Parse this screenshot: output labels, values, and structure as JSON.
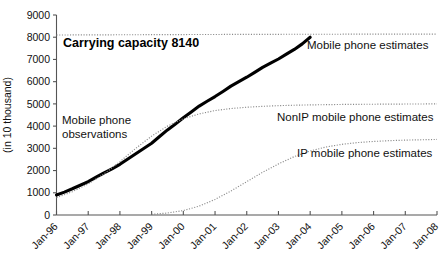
{
  "chart_data": {
    "type": "line",
    "title": "",
    "xlabel": "",
    "ylabel": "(in 10 thousand)",
    "xlim": [
      1996.0,
      2008.0
    ],
    "ylim": [
      0,
      9000
    ],
    "grid": false,
    "legend_position": "inline-annotations",
    "x_tick_labels": [
      "Jan-96",
      "Jan-97",
      "Jan-98",
      "Jan-99",
      "Jan-00",
      "Jan-01",
      "Jan-02",
      "Jan-03",
      "Jan-04",
      "Jan-05",
      "Jan-06",
      "Jan-07",
      "Jan-08"
    ],
    "y_tick_labels": [
      "0",
      "1000",
      "2000",
      "3000",
      "4000",
      "5000",
      "6000",
      "7000",
      "8000",
      "9000"
    ],
    "y_ticks": [
      0,
      1000,
      2000,
      3000,
      4000,
      5000,
      6000,
      7000,
      8000,
      9000
    ],
    "annotations": [
      {
        "id": "carrying-capacity",
        "text": "Carrying capacity 8140",
        "value": 8140,
        "bold": true
      },
      {
        "id": "mobile-phone-observations",
        "text": "Mobile phone\nobservations",
        "line1": "Mobile phone",
        "line2": "observations",
        "bold": false
      },
      {
        "id": "mobile-phone-estimates",
        "text": "Mobile phone estimates",
        "bold": false
      },
      {
        "id": "nonip-mobile-phone-estimates",
        "text": "NonIP mobile phone estimates",
        "bold": false
      },
      {
        "id": "ip-mobile-phone-estimates",
        "text": "IP mobile phone estimates",
        "bold": false
      }
    ],
    "series": [
      {
        "name": "Mobile phone observations",
        "style": "solid-thick",
        "color": "#000000",
        "x": [
          1996.0,
          1996.25,
          1996.5,
          1996.75,
          1997.0,
          1997.25,
          1997.5,
          1997.75,
          1998.0,
          1998.25,
          1998.5,
          1998.75,
          1999.0,
          1999.25,
          1999.5,
          1999.75,
          2000.0,
          2000.25,
          2000.5,
          2000.75,
          2001.0,
          2001.25,
          2001.5,
          2001.75,
          2002.0,
          2002.25,
          2002.5,
          2002.75,
          2003.0,
          2003.25,
          2003.5,
          2003.75,
          2004.0
        ],
        "values": [
          900,
          1030,
          1180,
          1340,
          1500,
          1700,
          1900,
          2080,
          2280,
          2520,
          2760,
          2990,
          3230,
          3530,
          3830,
          4100,
          4380,
          4640,
          4900,
          5120,
          5330,
          5560,
          5800,
          6000,
          6200,
          6420,
          6640,
          6830,
          7020,
          7240,
          7450,
          7700,
          8000
        ]
      },
      {
        "name": "Mobile phone estimates",
        "style": "dotted",
        "color": "#8a8a8a",
        "asymptote": 8140,
        "x": [
          1996.0,
          1997.0,
          1998.0,
          1999.0,
          2000.0,
          2001.0,
          2002.0,
          2003.0,
          2004.0,
          2005.0,
          2006.0,
          2007.0,
          2008.0
        ],
        "values": [
          8100,
          8105,
          8110,
          8115,
          8120,
          8124,
          8128,
          8131,
          8134,
          8136,
          8138,
          8139,
          8140
        ]
      },
      {
        "name": "NonIP mobile phone estimates",
        "style": "dotted",
        "color": "#8a8a8a",
        "asymptote": 5000,
        "x": [
          1996.0,
          1996.5,
          1997.0,
          1997.5,
          1998.0,
          1998.5,
          1999.0,
          1999.5,
          2000.0,
          2000.5,
          2001.0,
          2001.5,
          2002.0,
          2002.5,
          2003.0,
          2003.5,
          2004.0,
          2005.0,
          2006.0,
          2007.0,
          2008.0
        ],
        "values": [
          780,
          1050,
          1400,
          1850,
          2400,
          3000,
          3550,
          4000,
          4330,
          4550,
          4700,
          4790,
          4850,
          4890,
          4920,
          4940,
          4955,
          4975,
          4985,
          4993,
          5000
        ]
      },
      {
        "name": "IP mobile phone estimates",
        "style": "dotted",
        "color": "#8a8a8a",
        "asymptote": 3400,
        "x": [
          1999.0,
          1999.5,
          2000.0,
          2000.5,
          2001.0,
          2001.5,
          2002.0,
          2002.5,
          2003.0,
          2003.5,
          2004.0,
          2004.5,
          2005.0,
          2005.5,
          2006.0,
          2006.5,
          2007.0,
          2007.5,
          2008.0
        ],
        "values": [
          30,
          90,
          200,
          400,
          700,
          1080,
          1500,
          1920,
          2300,
          2630,
          2880,
          3060,
          3180,
          3260,
          3310,
          3345,
          3370,
          3385,
          3400
        ]
      }
    ]
  }
}
